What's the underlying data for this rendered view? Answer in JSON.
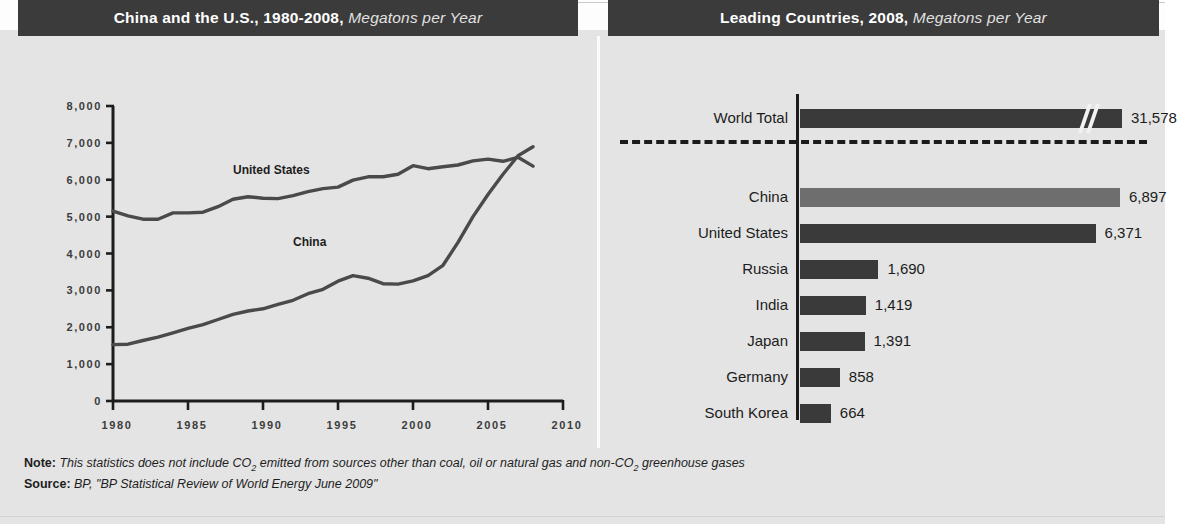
{
  "panels": {
    "left": {
      "title_main": "China and the U.S., 1980-2008,",
      "title_unit": " Megatons per Year"
    },
    "right": {
      "title_main": "Leading Countries, 2008,",
      "title_unit": " Megatons per Year"
    }
  },
  "footnotes": {
    "note_lead": "Note:",
    "note_a": " This statistics does not include CO",
    "note_sub": "2",
    "note_b": " emitted from sources other than coal, oil or natural gas and non-CO",
    "note_sub2": "2",
    "note_c": " greenhouse gases",
    "source_lead": "Source:",
    "source_text": " BP, \"BP Statistical Review of World Energy June 2009\""
  },
  "colors": {
    "header_bar": "#3b3b3b",
    "background": "#e4e4e4",
    "bar_dark": "#3a3a3a",
    "bar_light": "#6e6e6e",
    "line": "#4a4a4a",
    "axis": "#1d1d1d"
  },
  "chart_data": [
    {
      "type": "line",
      "title": "China and the U.S., 1980-2008, Megatons per Year",
      "xlabel": "",
      "ylabel": "",
      "unit": "Megatons per Year",
      "grid": false,
      "legend": "inline-labels",
      "xlim": [
        1980,
        2010
      ],
      "ylim": [
        0,
        8000
      ],
      "xticks": [
        "1980",
        "1985",
        "1990",
        "1995",
        "2000",
        "2005",
        "2010"
      ],
      "yticks": [
        "0",
        "1,000",
        "2,000",
        "3,000",
        "4,000",
        "5,000",
        "6,000",
        "7,000",
        "8,000"
      ],
      "x": [
        1980,
        1981,
        1982,
        1983,
        1984,
        1985,
        1986,
        1987,
        1988,
        1989,
        1990,
        1991,
        1992,
        1993,
        1994,
        1995,
        1996,
        1997,
        1998,
        1999,
        2000,
        2001,
        2002,
        2003,
        2004,
        2005,
        2006,
        2007,
        2008
      ],
      "series": [
        {
          "name": "United States",
          "label_x": 1988,
          "label_y": 6150,
          "values": [
            5150,
            5020,
            4930,
            4930,
            5100,
            5100,
            5120,
            5270,
            5470,
            5540,
            5500,
            5490,
            5570,
            5680,
            5760,
            5800,
            5990,
            6080,
            6080,
            6150,
            6380,
            6300,
            6350,
            6400,
            6510,
            6560,
            6500,
            6610,
            6371
          ]
        },
        {
          "name": "China",
          "label_x": 1992,
          "label_y": 4200,
          "values": [
            1530,
            1540,
            1640,
            1730,
            1850,
            1970,
            2070,
            2210,
            2350,
            2440,
            2500,
            2620,
            2730,
            2910,
            3030,
            3250,
            3400,
            3330,
            3180,
            3170,
            3260,
            3400,
            3680,
            4300,
            5000,
            5600,
            6150,
            6650,
            6897
          ]
        }
      ]
    },
    {
      "type": "bar",
      "orientation": "horizontal",
      "title": "Leading Countries, 2008, Megatons per Year",
      "unit": "Megatons per Year",
      "axis_break": true,
      "break_note": "World Total bar is truncated with a break mark",
      "categories": [
        "World Total",
        "China",
        "United States",
        "Russia",
        "India",
        "Japan",
        "Germany",
        "South Korea"
      ],
      "values": [
        31578,
        6897,
        6371,
        1690,
        1419,
        1391,
        858,
        664
      ],
      "value_labels": [
        "31,578",
        "6,897",
        "6,371",
        "1,690",
        "1,419",
        "1,391",
        "858",
        "664"
      ],
      "highlight": "China"
    }
  ]
}
